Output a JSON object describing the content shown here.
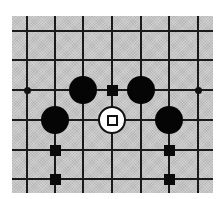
{
  "diagram": {
    "type": "go-board-fragment",
    "board_color": "#c6c6c6",
    "line_color": "#1a1a1a",
    "columns_px": [
      27,
      55,
      83,
      112,
      141,
      169,
      198
    ],
    "rows_px": [
      31,
      60,
      90,
      120,
      150,
      179
    ],
    "board_rect": {
      "left": 12,
      "top": 16,
      "right": 213,
      "bottom": 193
    },
    "stones": [
      {
        "color": "black",
        "col": 2,
        "row": 2
      },
      {
        "color": "black",
        "col": 4,
        "row": 2
      },
      {
        "color": "black",
        "col": 1,
        "row": 3
      },
      {
        "color": "black",
        "col": 5,
        "row": 3
      },
      {
        "color": "white",
        "col": 3,
        "row": 3,
        "marker": "square"
      }
    ],
    "star_points": [
      {
        "col": 0,
        "row": 2
      },
      {
        "col": 6,
        "row": 2
      }
    ],
    "square_markers": [
      {
        "col": 3,
        "row": 2
      },
      {
        "col": 1,
        "row": 4
      },
      {
        "col": 1,
        "row": 5
      },
      {
        "col": 5,
        "row": 4
      },
      {
        "col": 5,
        "row": 5
      }
    ]
  }
}
